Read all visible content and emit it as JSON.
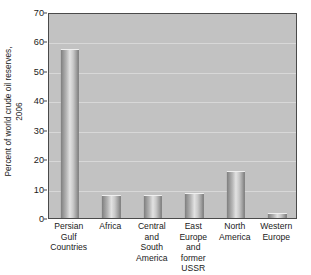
{
  "chart_data": {
    "type": "bar",
    "title": "",
    "subtitle": "",
    "xlabel": "",
    "ylabel": "Percent of world crude oil reserves, 2006",
    "ylabel_lines": [
      "Percent of world crude oil reserves,",
      "2006"
    ],
    "categories": [
      "Persian\nGulf\nCountries",
      "Africa",
      "Central\nand\nSouth\nAmerica",
      "East\nEurope\nand\nformer\nUSSR",
      "North\nAmerica",
      "Western\nEurope"
    ],
    "categories_flat": [
      "Persian Gulf Countries",
      "Africa",
      "Central and South America",
      "East Europe and former USSR",
      "North America",
      "Western Europe"
    ],
    "values": [
      57,
      7.5,
      7.5,
      8,
      15.5,
      1.5
    ],
    "ylim": [
      0,
      70
    ],
    "yticks": [
      0,
      10,
      20,
      30,
      40,
      50,
      60,
      70
    ],
    "ytick_labels": [
      "0",
      "10",
      "20",
      "30",
      "40",
      "50",
      "60",
      "70"
    ],
    "grid": true,
    "grid_axis": "y",
    "legend": false,
    "legend_position": "none",
    "colors": {
      "plot_background": "#c2c2c2",
      "gridline": "#d8d8d8",
      "plot_border": "#4a4a4a",
      "bar_light": "#e2e2e2",
      "bar_dark": "#767676",
      "text": "#1a1a1a",
      "page_background": "#ffffff"
    }
  }
}
